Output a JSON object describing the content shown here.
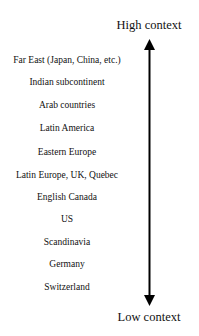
{
  "diagram": {
    "type": "vertical-scale",
    "top_label": "High context",
    "bottom_label": "Low context",
    "countries": [
      "Far East (Japan, China, etc.)",
      "Indian subcontinent",
      "Arab countries",
      "Latin America",
      "Eastern Europe",
      "Latin Europe, UK, Quebec",
      "English Canada",
      "US",
      "Scandinavia",
      "Germany",
      "Switzerland"
    ],
    "arrow": {
      "direction": "bidirectional-vertical",
      "color": "#000000"
    }
  }
}
